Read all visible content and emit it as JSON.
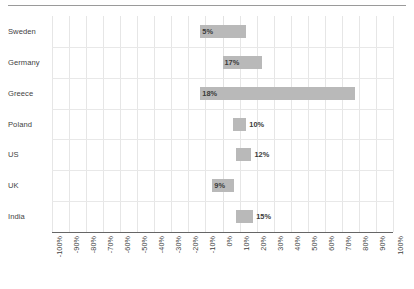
{
  "chart_data": {
    "type": "bar",
    "orientation": "horizontal",
    "subtype": "floating-range-bar",
    "title": "",
    "subtitle": "",
    "xlabel": "",
    "ylabel": "",
    "xlim": [
      -100,
      100
    ],
    "xtick_step": 10,
    "grid": true,
    "legend": null,
    "legend_position": "none",
    "bar_color": "#b9b9b9",
    "gridline_color": "#e6e6e6",
    "axis_color": "#666666",
    "text_color": "#3f3f3f",
    "categories": [
      "Sweden",
      "Germany",
      "Greece",
      "Poland",
      "US",
      "UK",
      "India"
    ],
    "xtick_labels": [
      "-100%",
      "-90%",
      "-80%",
      "-70%",
      "-60%",
      "-50%",
      "-40%",
      "-30%",
      "-20%",
      "-10%",
      "0%",
      "10%",
      "20%",
      "30%",
      "40%",
      "50%",
      "60%",
      "70%",
      "80%",
      "90%",
      "100%"
    ],
    "xtick_values": [
      -100,
      -90,
      -80,
      -70,
      -60,
      -50,
      -40,
      -30,
      -20,
      -10,
      0,
      10,
      20,
      30,
      40,
      50,
      60,
      70,
      80,
      90,
      100
    ],
    "bars": [
      {
        "category": "Sweden",
        "start": -13,
        "end": 14,
        "label": "5%",
        "label_position": "inside"
      },
      {
        "category": "Germany",
        "start": 0,
        "end": 23,
        "label": "17%",
        "label_position": "inside"
      },
      {
        "category": "Greece",
        "start": -13,
        "end": 78,
        "label": "18%",
        "label_position": "inside"
      },
      {
        "category": "Poland",
        "start": 6,
        "end": 14,
        "label": "10%",
        "label_position": "outside"
      },
      {
        "category": "US",
        "start": 8,
        "end": 17,
        "label": "12%",
        "label_position": "outside"
      },
      {
        "category": "UK",
        "start": -6,
        "end": 7,
        "label": "9%",
        "label_position": "inside"
      },
      {
        "category": "India",
        "start": 8,
        "end": 18,
        "label": "15%",
        "label_position": "outside"
      }
    ],
    "values": [
      5,
      17,
      18,
      10,
      12,
      9,
      15
    ]
  }
}
